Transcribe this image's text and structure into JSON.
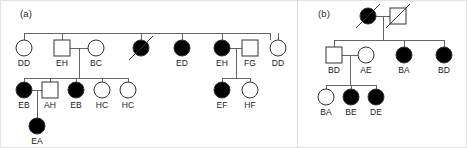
{
  "figure": {
    "width": 467,
    "height": 148,
    "background": "#ffffff",
    "line_color": "#555555",
    "symbol_stroke": "#333333",
    "affected_fill": "#000000",
    "unaffected_fill": "#ffffff",
    "border_color": "#c8c8c8",
    "divider_x": 297
  },
  "panels": [
    {
      "id": "a",
      "label": "(a)",
      "x": 20,
      "y": 8
    },
    {
      "id": "b",
      "label": "(b)",
      "x": 318,
      "y": 8
    }
  ],
  "legend_semantics": {
    "circle": "female",
    "square": "male",
    "filled": "affected",
    "open": "unaffected",
    "slash": "deceased"
  },
  "panel_a": {
    "generation_I": {
      "sibship_line_y": 33,
      "sibship_x_start": 24,
      "sibship_x_end": 270,
      "members": [
        {
          "id": "a1-dd",
          "label": "DD",
          "shape": "circle",
          "affected": false,
          "deceased": false,
          "cx": 24,
          "cy": 48
        },
        {
          "id": "a1-eh",
          "label": "EH",
          "shape": "square",
          "affected": false,
          "deceased": false,
          "cx": 62,
          "cy": 48
        },
        {
          "id": "a1-bc",
          "label": "BC",
          "shape": "circle",
          "affected": false,
          "deceased": false,
          "cx": 96,
          "cy": 48
        },
        {
          "id": "a1-unk",
          "label": "",
          "shape": "circle",
          "affected": true,
          "deceased": true,
          "cx": 141,
          "cy": 48
        },
        {
          "id": "a1-ed",
          "label": "ED",
          "shape": "circle",
          "affected": true,
          "deceased": false,
          "cx": 182,
          "cy": 48
        },
        {
          "id": "a1-eh2",
          "label": "EH",
          "shape": "circle",
          "affected": true,
          "deceased": false,
          "cx": 222,
          "cy": 48
        },
        {
          "id": "a1-fg",
          "label": "FG",
          "shape": "square",
          "affected": false,
          "deceased": false,
          "cx": 250,
          "cy": 48
        },
        {
          "id": "a1-dd2",
          "label": "DD",
          "shape": "circle",
          "affected": false,
          "deceased": false,
          "cx": 278,
          "cy": 48
        }
      ],
      "drop_positions": [
        24,
        62,
        141,
        182,
        222,
        270
      ],
      "matings": [
        {
          "id": "a-mate-eh-bc",
          "left": 62,
          "right": 96,
          "y": 48,
          "descent_x": 79,
          "sibship_y": 78
        },
        {
          "id": "a-mate-eh-fg",
          "left": 222,
          "right": 250,
          "y": 48,
          "descent_x": 236,
          "sibship_y": 78
        }
      ]
    },
    "generation_II": {
      "sibship_lines": [
        {
          "id": "a2-sib-left",
          "y": 78,
          "x_start": 24,
          "x_end": 128
        },
        {
          "id": "a2-sib-right",
          "y": 78,
          "x_start": 222,
          "x_end": 250
        }
      ],
      "members": [
        {
          "id": "a2-eb",
          "label": "EB",
          "shape": "circle",
          "affected": true,
          "deceased": false,
          "cx": 24,
          "cy": 90
        },
        {
          "id": "a2-ah",
          "label": "AH",
          "shape": "square",
          "affected": false,
          "deceased": false,
          "cx": 50,
          "cy": 90
        },
        {
          "id": "a2-eb2",
          "label": "EB",
          "shape": "circle",
          "affected": true,
          "deceased": false,
          "cx": 76,
          "cy": 90
        },
        {
          "id": "a2-hc",
          "label": "HC",
          "shape": "circle",
          "affected": false,
          "deceased": false,
          "cx": 102,
          "cy": 90
        },
        {
          "id": "a2-hc2",
          "label": "HC",
          "shape": "circle",
          "affected": false,
          "deceased": false,
          "cx": 128,
          "cy": 90
        },
        {
          "id": "a2-ef",
          "label": "EF",
          "shape": "circle",
          "affected": true,
          "deceased": false,
          "cx": 222,
          "cy": 90
        },
        {
          "id": "a2-hf",
          "label": "HF",
          "shape": "circle",
          "affected": false,
          "deceased": false,
          "cx": 250,
          "cy": 90
        }
      ],
      "matings": [
        {
          "id": "a-mate-eb-ah",
          "left": 24,
          "right": 50,
          "y": 90,
          "descent_x": 37,
          "sibship_y": 118
        }
      ]
    },
    "generation_III": {
      "members": [
        {
          "id": "a3-ea",
          "label": "EA",
          "shape": "circle",
          "affected": true,
          "deceased": false,
          "cx": 37,
          "cy": 126
        }
      ]
    }
  },
  "panel_b": {
    "generation_I": {
      "members": [
        {
          "id": "b1-f",
          "label": "",
          "shape": "circle",
          "affected": true,
          "deceased": true,
          "cx": 368,
          "cy": 16
        },
        {
          "id": "b1-m",
          "label": "",
          "shape": "square",
          "affected": false,
          "deceased": true,
          "cx": 398,
          "cy": 16
        }
      ],
      "mating": {
        "id": "b-mate-top",
        "left": 368,
        "right": 398,
        "y": 16,
        "descent_x": 383,
        "sibship_y": 40
      }
    },
    "generation_II": {
      "sibship_line": {
        "id": "b2-sib",
        "y": 40,
        "x_start": 334,
        "x_end": 444
      },
      "members": [
        {
          "id": "b2-bd",
          "label": "BD",
          "shape": "square",
          "affected": false,
          "deceased": false,
          "cx": 334,
          "cy": 55
        },
        {
          "id": "b2-ae",
          "label": "AE",
          "shape": "circle",
          "affected": false,
          "deceased": false,
          "cx": 366,
          "cy": 55
        },
        {
          "id": "b2-ba",
          "label": "BA",
          "shape": "circle",
          "affected": true,
          "deceased": false,
          "cx": 404,
          "cy": 55
        },
        {
          "id": "b2-bd2",
          "label": "BD",
          "shape": "circle",
          "affected": true,
          "deceased": false,
          "cx": 444,
          "cy": 55
        }
      ],
      "drop_positions": [
        334,
        404,
        444
      ],
      "mating": {
        "id": "b-mate-bd-ae",
        "left": 334,
        "right": 366,
        "y": 55,
        "descent_x": 350,
        "sibship_y": 85
      }
    },
    "generation_III": {
      "sibship_line": {
        "id": "b3-sib",
        "y": 85,
        "x_start": 326,
        "x_end": 376
      },
      "members": [
        {
          "id": "b3-ba",
          "label": "BA",
          "shape": "circle",
          "affected": false,
          "deceased": false,
          "cx": 326,
          "cy": 97
        },
        {
          "id": "b3-be",
          "label": "BE",
          "shape": "circle",
          "affected": true,
          "deceased": false,
          "cx": 351,
          "cy": 97
        },
        {
          "id": "b3-de",
          "label": "DE",
          "shape": "circle",
          "affected": true,
          "deceased": false,
          "cx": 376,
          "cy": 97
        }
      ]
    }
  }
}
